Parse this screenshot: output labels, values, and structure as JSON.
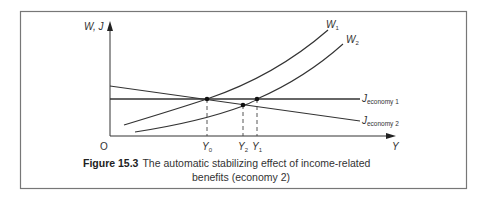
{
  "figure": {
    "caption_number": "Figure 15.3",
    "caption_line1": "The automatic stabilizing effect of income-related",
    "caption_line2": "benefits (economy 2)"
  },
  "axes": {
    "y_label": "W, J",
    "x_label": "Y",
    "origin_label": "O"
  },
  "curves": {
    "w1_label": "W",
    "w1_sub": "1",
    "w2_label": "W",
    "w2_sub": "2",
    "j1_label": "J",
    "j1_sub": "economy 1",
    "j2_label": "J",
    "j2_sub": "economy 2"
  },
  "points": {
    "y0_label": "Y",
    "y0_sub": "0",
    "y2_label": "Y",
    "y2_sub": "2",
    "y1_label": "Y",
    "y1_sub": "1"
  },
  "colors": {
    "line": "#333333",
    "frame": "#777777"
  }
}
